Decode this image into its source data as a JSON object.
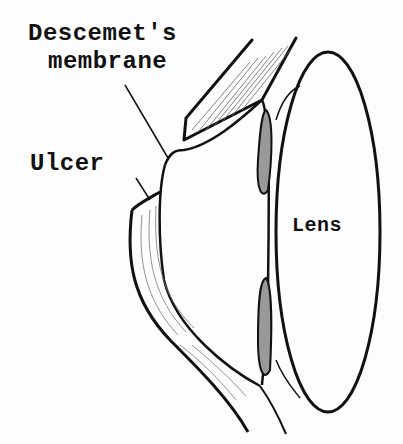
{
  "diagram": {
    "type": "anatomical-illustration",
    "labels": {
      "descemet_line1": "Descemet's",
      "descemet_line2": "membrane",
      "ulcer": "Ulcer",
      "lens": "Lens"
    },
    "colors": {
      "ink": "#111111",
      "background": "#fdfdfd",
      "hatch": "#555555"
    }
  }
}
